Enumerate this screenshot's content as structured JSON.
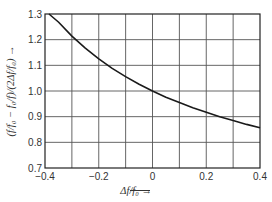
{
  "chart_data": {
    "type": "line",
    "title": "",
    "xlabel": "Δf/f₀ →",
    "ylabel": "(f/f₀ − f₀/f)/(2Δf/f₀) →",
    "xlim": [
      -0.4,
      0.4
    ],
    "ylim": [
      0.7,
      1.3
    ],
    "grid": true,
    "legend": "none",
    "x_ticks": [
      "−0.4",
      "−0.2",
      "0",
      "0.2",
      "0.4"
    ],
    "x_tick_values": [
      -0.4,
      -0.2,
      0,
      0.2,
      0.4
    ],
    "y_ticks": [
      "0.7",
      "0.8",
      "0.9",
      "1.0",
      "1.1",
      "1.2",
      "1.3"
    ],
    "y_tick_values": [
      0.7,
      0.8,
      0.9,
      1.0,
      1.1,
      1.2,
      1.3
    ],
    "series": [
      {
        "name": "(f/f₀ − f₀/f)/(2Δf/f₀)",
        "x": [
          -0.385,
          -0.35,
          -0.3,
          -0.25,
          -0.2,
          -0.15,
          -0.1,
          -0.05,
          0,
          0.05,
          0.1,
          0.15,
          0.2,
          0.25,
          0.3,
          0.35,
          0.4
        ],
        "y": [
          1.313,
          1.269,
          1.214,
          1.167,
          1.125,
          1.088,
          1.056,
          1.026,
          1.0,
          0.976,
          0.955,
          0.935,
          0.917,
          0.9,
          0.885,
          0.87,
          0.857
        ]
      }
    ]
  },
  "colors": {
    "line": "#1a1a1a",
    "grid": "#555555",
    "background": "#ffffff"
  }
}
